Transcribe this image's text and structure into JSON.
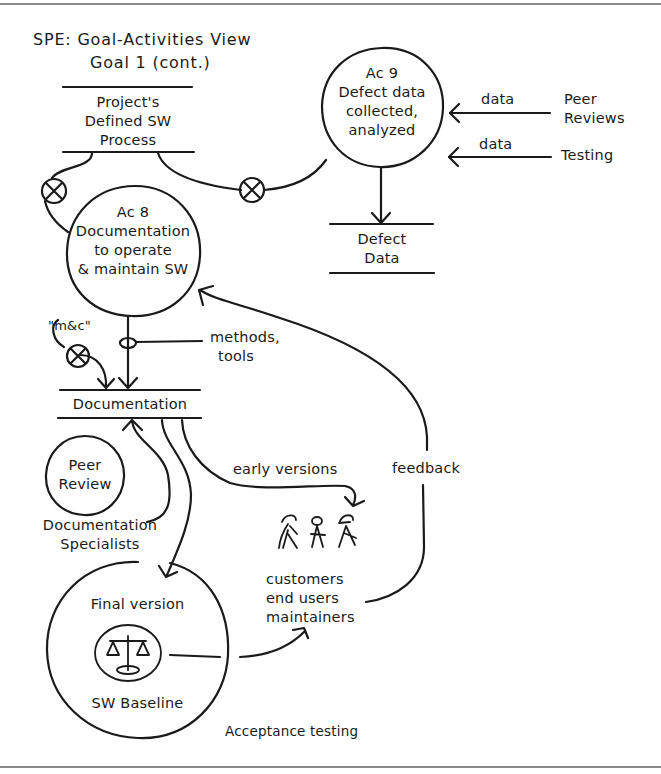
{
  "title": {
    "line1": "SPE: Goal-Activities View",
    "line2": "Goal 1 (cont.)"
  },
  "stores": {
    "project_process": [
      "Project's",
      "Defined SW",
      "Process"
    ],
    "defect_data": [
      "Defect",
      "Data"
    ],
    "documentation": "Documentation"
  },
  "activities": {
    "ac9": [
      "Ac 9",
      "Defect data",
      "collected,",
      "analyzed"
    ],
    "ac8": [
      "Ac 8",
      "Documentation",
      "to operate",
      "& maintain SW"
    ],
    "peer_review": [
      "Peer",
      "Review"
    ],
    "final_version": {
      "top": "Final version",
      "bottom": "SW Baseline",
      "icon": "scales-icon"
    }
  },
  "external_sources": {
    "peer_reviews": [
      "Peer",
      "Reviews"
    ],
    "testing": "Testing"
  },
  "flow_labels": {
    "data_1": "data",
    "data_2": "data",
    "mc": "\"m&c\"",
    "methods_tools": [
      "methods,",
      "tools"
    ],
    "early_versions": "early versions",
    "feedback": "feedback",
    "doc_specialists": [
      "Documentation",
      "Specialists"
    ],
    "acceptance_testing": "Acceptance testing"
  },
  "actors": {
    "icon": "people-group-icon",
    "lines": [
      "customers",
      "end users",
      "maintainers"
    ]
  },
  "colors": {
    "ink": "#1a1a1a",
    "frame": "#8a8a8a",
    "background": "#ffffff"
  }
}
